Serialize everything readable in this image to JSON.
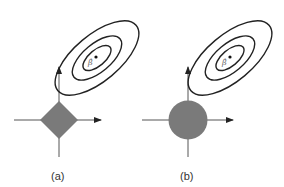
{
  "figure": {
    "panels": [
      {
        "label": "(a)",
        "constraint_shape": "diamond",
        "constraint_color": "#7a7a7a",
        "estimate_label": "β̂",
        "contour_count": 3
      },
      {
        "label": "(b)",
        "constraint_shape": "circle",
        "constraint_color": "#7a7a7a",
        "estimate_label": "β̂",
        "contour_count": 3
      }
    ],
    "colors": {
      "axis": "#555555",
      "contour": "#222222",
      "constraint_fill": "#7a7a7a",
      "background": "#ffffff"
    }
  }
}
